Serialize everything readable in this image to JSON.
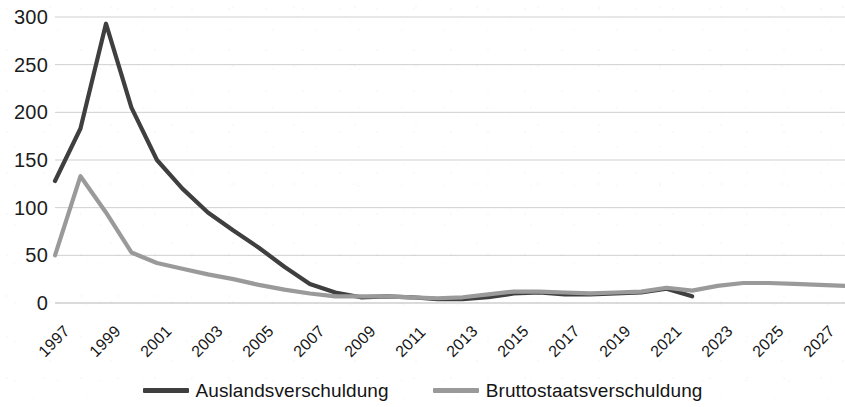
{
  "chart_data": {
    "type": "line",
    "title": "",
    "xlabel": "",
    "ylabel": "",
    "ylim": [
      0,
      300
    ],
    "xlim": [
      1997,
      2028
    ],
    "grid": true,
    "legend_position": "bottom",
    "y_ticks": [
      "0",
      "50",
      "100",
      "150",
      "200",
      "250",
      "300"
    ],
    "y_tick_values": [
      0,
      50,
      100,
      150,
      200,
      250,
      300
    ],
    "x_ticks": [
      "1997",
      "1999",
      "2001",
      "2003",
      "2005",
      "2007",
      "2009",
      "2011",
      "2013",
      "2015",
      "2017",
      "2019",
      "2021",
      "2023",
      "2025",
      "2027"
    ],
    "x_tick_values": [
      1997,
      1999,
      2001,
      2003,
      2005,
      2007,
      2009,
      2011,
      2013,
      2015,
      2017,
      2019,
      2021,
      2023,
      2025,
      2027
    ],
    "x": [
      1997,
      1998,
      1999,
      2000,
      2001,
      2002,
      2003,
      2004,
      2005,
      2006,
      2007,
      2008,
      2009,
      2010,
      2011,
      2012,
      2013,
      2014,
      2015,
      2016,
      2017,
      2018,
      2019,
      2020,
      2021,
      2022,
      2023,
      2024,
      2025,
      2026,
      2027,
      2028
    ],
    "series": [
      {
        "name": "Auslandsverschuldung",
        "color": "#3f3f3f",
        "values": [
          128,
          183,
          293,
          205,
          150,
          120,
          95,
          76,
          58,
          38,
          20,
          11,
          6,
          7,
          6,
          4,
          4,
          6,
          10,
          11,
          9,
          9,
          10,
          11,
          15,
          7,
          null,
          null,
          null,
          null,
          null,
          null
        ]
      },
      {
        "name": "Bruttostaatsverschuldung",
        "color": "#9a9a9a",
        "values": [
          50,
          133,
          95,
          53,
          42,
          36,
          30,
          25,
          19,
          14,
          10,
          7,
          7,
          7,
          6,
          5,
          6,
          9,
          12,
          12,
          11,
          10,
          11,
          12,
          16,
          13,
          18,
          21,
          21,
          20,
          19,
          18
        ]
      }
    ]
  },
  "legend": {
    "items": [
      {
        "label": "Auslandsverschuldung",
        "color": "#3f3f3f"
      },
      {
        "label": "Bruttostaatsverschuldung",
        "color": "#9a9a9a"
      }
    ]
  },
  "axes": {
    "gridline_color": "#cfcfcf",
    "tick_label_color": "#1c1c1c"
  }
}
